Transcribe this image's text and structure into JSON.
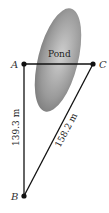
{
  "diagram": {
    "pond_label": "Pond",
    "points": {
      "A": {
        "label": "A",
        "x": 24,
        "y": 64
      },
      "B": {
        "label": "B",
        "x": 24,
        "y": 196
      },
      "C": {
        "label": "C",
        "x": 93,
        "y": 64
      }
    },
    "segments": {
      "AB": {
        "label": "139.3 m"
      },
      "BC": {
        "label": "158.2 m"
      }
    },
    "colors": {
      "line": "#111111",
      "pond_dark": "#7a7a7a",
      "pond_light": "#c8c8c8"
    }
  }
}
